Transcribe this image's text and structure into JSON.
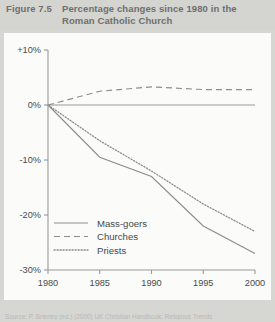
{
  "figure": {
    "number": "Figure 7.5",
    "title": "Percentage changes since 1980 in the Roman Catholic Church",
    "title_line1": "Percentage changes since 1980 in the",
    "title_line2": "Roman Catholic Church",
    "source": "Source: P. Brierley (ed.) (2000) UK Christian Handbook: Religious Trends"
  },
  "colors": {
    "page_background": "#d6d6d3",
    "panel_background": "#fbfbfa",
    "title_text": "#6f6f6d",
    "axis": "#9a9a97",
    "tick_text": "#4a4a48",
    "series_line": "#8d8d8a",
    "source_text": "#b9b9b6"
  },
  "chart_data": {
    "type": "line",
    "title": "Percentage changes since 1980 in the Roman Catholic Church",
    "xlabel": "",
    "ylabel": "",
    "x": [
      1980,
      1985,
      1990,
      1995,
      2000
    ],
    "xticklabels": [
      "1980",
      "1985",
      "1990",
      "1995",
      "2000"
    ],
    "xlim": [
      1980,
      2000
    ],
    "yticks": [
      10,
      0,
      -10,
      -20,
      -30
    ],
    "yticklabels": [
      "+10%",
      "0%",
      "-10%",
      "-20%",
      "-30%"
    ],
    "ylim": [
      -30,
      10
    ],
    "grid": false,
    "legend_position": "lower-left-inside",
    "series": [
      {
        "name": "Mass-goers",
        "style": "solid",
        "values": [
          0,
          -9.5,
          -13,
          -22,
          -27
        ]
      },
      {
        "name": "Churches",
        "style": "dashed",
        "values": [
          0,
          2.5,
          3.3,
          2.8,
          2.8
        ]
      },
      {
        "name": "Priests",
        "style": "dotted",
        "values": [
          0,
          -6.5,
          -12,
          -18,
          -23
        ]
      }
    ]
  },
  "legend": {
    "items": [
      {
        "label": "Mass-goers",
        "style": "solid"
      },
      {
        "label": "Churches",
        "style": "dashed"
      },
      {
        "label": "Priests",
        "style": "dotted"
      }
    ]
  }
}
